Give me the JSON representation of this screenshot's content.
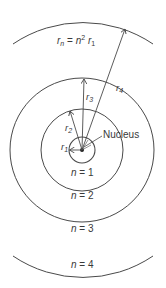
{
  "diagram": {
    "formula": {
      "lhs": "r",
      "lhs_sub": "n",
      "eq": " = ",
      "n": "n",
      "exp": "2",
      "r": "r",
      "r_sub": "1"
    },
    "nucleus_label": "Nucleus",
    "radii": [
      {
        "symbol": "r",
        "sub": "1"
      },
      {
        "symbol": "r",
        "sub": "2"
      },
      {
        "symbol": "r",
        "sub": "3"
      },
      {
        "symbol": "r",
        "sub": "4"
      }
    ],
    "orbits": [
      {
        "label_n": "n",
        "label_eq": " = ",
        "label_val": "1"
      },
      {
        "label_n": "n",
        "label_eq": " = ",
        "label_val": "2"
      },
      {
        "label_n": "n",
        "label_eq": " = ",
        "label_val": "3"
      },
      {
        "label_n": "n",
        "label_eq": " = ",
        "label_val": "4"
      }
    ],
    "colors": {
      "line": "#4a4a4a",
      "text": "#3a3a3a",
      "background": "#ffffff"
    }
  }
}
